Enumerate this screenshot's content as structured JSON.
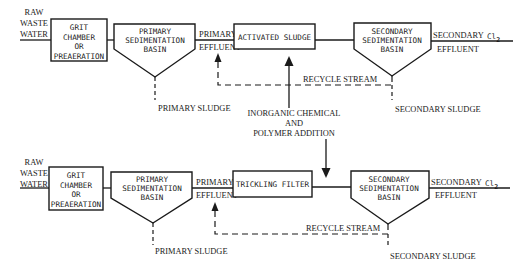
{
  "diagram": {
    "top_flow": {
      "input": [
        "RAW",
        "WASTE",
        "WATER"
      ],
      "grit_chamber": [
        "GRIT",
        "CHAMBER",
        "OR",
        "PREAERATION"
      ],
      "primary_basin": [
        "PRIMARY",
        "SEDIMENTATION",
        "BASIN"
      ],
      "primary_effluent": [
        "PRIMARY",
        "EFFLUENT"
      ],
      "biological_unit": "ACTIVATED SLUDGE",
      "secondary_basin": [
        "SECONDARY",
        "SEDIMENTATION",
        "BASIN"
      ],
      "secondary_effluent": [
        "SECONDARY",
        "EFFLUENT"
      ],
      "disinfection": "Cl",
      "disinfection_sub": "2",
      "recycle": "RECYCLE STREAM",
      "primary_sludge": "PRIMARY SLUDGE",
      "secondary_sludge": "SECONDARY SLUDGE"
    },
    "chemical_addition": [
      "INORGANIC CHEMICAL",
      "AND",
      "POLYMER ADDITION"
    ],
    "bottom_flow": {
      "input": [
        "RAW",
        "WASTE",
        "WATER"
      ],
      "grit_chamber": [
        "GRIT",
        "CHAMBER",
        "OR",
        "PREAERATION"
      ],
      "primary_basin": [
        "PRIMARY",
        "SEDIMENTATION",
        "BASIN"
      ],
      "primary_effluent": [
        "PRIMARY",
        "EFFLUENT"
      ],
      "biological_unit": "TRICKLING FILTER",
      "secondary_basin": [
        "SECONDARY",
        "SEDIMENTATION",
        "BASIN"
      ],
      "secondary_effluent": [
        "SECONDARY",
        "EFFLUENT"
      ],
      "disinfection": "Cl",
      "disinfection_sub": "2",
      "recycle": "RECYCLE STREAM",
      "primary_sludge": "PRIMARY SLUDGE",
      "secondary_sludge": "SECONDARY SLUDGE"
    },
    "colors": {
      "ink": "#1a1a1a",
      "background": "#ffffff"
    }
  }
}
